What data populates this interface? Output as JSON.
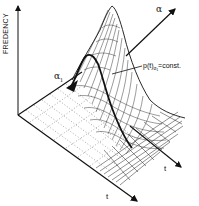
{
  "figure": {
    "type": "3d-surface-plot",
    "y_axis_label": "FREDENCY",
    "alpha_axis_label": "α",
    "alpha1_label": "α",
    "alpha1_subscript": "1",
    "t_axis_label_front": "t",
    "t_axis_label_back": "t",
    "curve_label_main": "p(t)",
    "curve_label_sub": "α₁",
    "curve_label_rest": "=const.",
    "line_color": "#111111",
    "background": "#ffffff"
  }
}
